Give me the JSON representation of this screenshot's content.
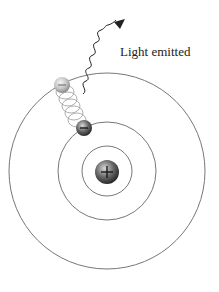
{
  "diagram": {
    "label_light": "Light emitted",
    "nucleus_symbol": "+",
    "electron_symbol": "−",
    "orbits": [
      "n=1",
      "n=2",
      "n=3"
    ],
    "colors": {
      "orbit": "#666666",
      "nucleus": "#555555",
      "electron": "#555555",
      "ghost_electron": "#bbbbbb",
      "photon": "#222222"
    }
  }
}
